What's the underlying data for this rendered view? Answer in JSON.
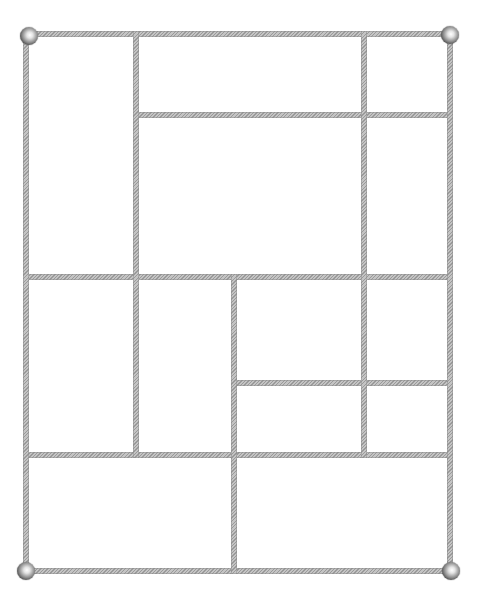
{
  "diagram": {
    "type": "rectangular-partition-frame",
    "bar_color": "#a8a8a8",
    "bar_thickness": 6,
    "frame": {
      "left": 26,
      "top": 34,
      "right": 450,
      "bottom": 571
    },
    "corner_balls": [
      {
        "name": "top-left",
        "x": 29,
        "y": 36
      },
      {
        "name": "top-right",
        "x": 450,
        "y": 35
      },
      {
        "name": "bottom-left",
        "x": 26,
        "y": 571
      },
      {
        "name": "bottom-right",
        "x": 451,
        "y": 571
      }
    ],
    "horizontal_bars": [
      {
        "y": 34,
        "x1": 26,
        "x2": 450
      },
      {
        "y": 115,
        "x1": 136,
        "x2": 450
      },
      {
        "y": 277,
        "x1": 26,
        "x2": 450
      },
      {
        "y": 383,
        "x1": 234,
        "x2": 450
      },
      {
        "y": 455,
        "x1": 26,
        "x2": 450
      },
      {
        "y": 571,
        "x1": 26,
        "x2": 450
      }
    ],
    "vertical_bars": [
      {
        "x": 26,
        "y1": 34,
        "y2": 571
      },
      {
        "x": 136,
        "y1": 34,
        "y2": 455
      },
      {
        "x": 364,
        "y1": 34,
        "y2": 455
      },
      {
        "x": 234,
        "y1": 277,
        "y2": 571
      },
      {
        "x": 450,
        "y1": 34,
        "y2": 571
      }
    ],
    "cell_count": 13
  }
}
